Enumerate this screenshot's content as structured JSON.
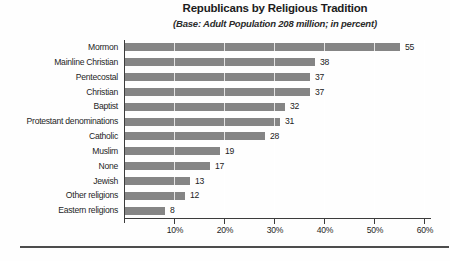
{
  "chart_data": {
    "type": "bar",
    "orientation": "horizontal",
    "title": "Republicans by Religious Tradition",
    "subtitle": "(Base: Adult Population 208 million; in percent)",
    "categories": [
      "Mormon",
      "Mainline Christian",
      "Pentecostal",
      "Christian",
      "Baptist",
      "Protestant denominations",
      "Catholic",
      "Muslim",
      "None",
      "Jewish",
      "Other religions",
      "Eastern religions"
    ],
    "values": [
      55,
      38,
      37,
      37,
      32,
      31,
      28,
      19,
      17,
      13,
      12,
      8
    ],
    "value_suffix": "percent",
    "xlim": [
      0,
      60
    ],
    "xtick_values": [
      10,
      20,
      30,
      40,
      50,
      60
    ],
    "xtick_labels": [
      "10%",
      "20%",
      "30%",
      "40%",
      "50%",
      "60%"
    ],
    "grid": "vertical light gridlines visible over bars",
    "legend": "none",
    "data_labels": "at end of each bar",
    "bar_color": "#858585",
    "axis_color": "#3c3c3c",
    "text_color": "#1f1f1f"
  }
}
